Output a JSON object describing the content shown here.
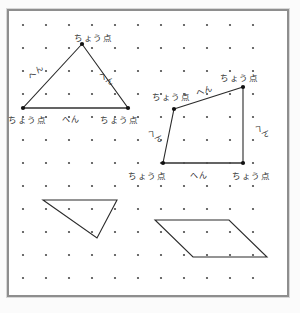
{
  "worksheet": {
    "title": "ちょう点とへん",
    "background_color": "#ffffff",
    "frame_color": "#8e8e8e",
    "line_color": "#2b2b2b",
    "label_color": "#2e2e2e"
  },
  "grid": {
    "columns": 11,
    "rows": 12,
    "spacing_px": 23,
    "origin_x": 23,
    "origin_y": 25,
    "dot_color": "#4a4a4a",
    "dot_radius": 1.1
  },
  "terms": {
    "vertex": "ちょう点",
    "edge": "へん"
  },
  "shapes": [
    {
      "id": "triangle-top-left",
      "type": "triangle",
      "labeled": true,
      "points": "82,44 23,108 128,108",
      "vertices": [
        {
          "x": 82,
          "y": 44
        },
        {
          "x": 23,
          "y": 108
        },
        {
          "x": 128,
          "y": 108
        }
      ],
      "base_emphasized": true
    },
    {
      "id": "quadrilateral-right",
      "type": "quadrilateral",
      "labeled": true,
      "points": "174,109 243,87 243,163 163,163",
      "vertices": [
        {
          "x": 174,
          "y": 109
        },
        {
          "x": 243,
          "y": 87
        },
        {
          "x": 243,
          "y": 163
        },
        {
          "x": 163,
          "y": 163
        }
      ],
      "base_emphasized": true
    },
    {
      "id": "triangle-bottom-left",
      "type": "triangle",
      "labeled": false,
      "points": "43,200 117,200 97,238",
      "vertices": [
        {
          "x": 43,
          "y": 200
        },
        {
          "x": 117,
          "y": 200
        },
        {
          "x": 97,
          "y": 238
        }
      ],
      "base_emphasized": false
    },
    {
      "id": "parallelogram-bottom-right",
      "type": "parallelogram",
      "labeled": false,
      "points": "155,220 229,220 267,257 193,257",
      "vertices": [
        {
          "x": 155,
          "y": 220
        },
        {
          "x": 229,
          "y": 220
        },
        {
          "x": 267,
          "y": 257
        },
        {
          "x": 193,
          "y": 257
        }
      ],
      "base_emphasized": false
    }
  ],
  "annotations": [
    {
      "id": "t1-vertex-top",
      "text": "ちょう点",
      "shape": "triangle-top-left",
      "kind": "vertex",
      "x": 74,
      "y": 34,
      "rotate": 0
    },
    {
      "id": "t1-edge-left",
      "text": "へん",
      "shape": "triangle-top-left",
      "kind": "edge",
      "x": 30,
      "y": 75,
      "rotate": -44
    },
    {
      "id": "t1-edge-right",
      "text": "へん",
      "shape": "triangle-top-left",
      "kind": "edge",
      "x": 99,
      "y": 70,
      "rotate": 36
    },
    {
      "id": "t1-vertex-bottom-left",
      "text": "ちょう点",
      "shape": "triangle-top-left",
      "kind": "vertex",
      "x": 8,
      "y": 116,
      "rotate": 0
    },
    {
      "id": "t1-edge-bottom",
      "text": "へん",
      "shape": "triangle-top-left",
      "kind": "edge",
      "x": 62,
      "y": 116,
      "rotate": 0
    },
    {
      "id": "t1-vertex-bottom-right",
      "text": "ちょう点",
      "shape": "triangle-top-left",
      "kind": "vertex",
      "x": 100,
      "y": 116,
      "rotate": 0
    },
    {
      "id": "q1-vertex-top-left",
      "text": "ちょう点",
      "shape": "quadrilateral-right",
      "kind": "vertex",
      "x": 152,
      "y": 93,
      "rotate": 0
    },
    {
      "id": "q1-edge-top",
      "text": "へん",
      "shape": "quadrilateral-right",
      "kind": "edge",
      "x": 196,
      "y": 90,
      "rotate": -17
    },
    {
      "id": "q1-vertex-top-right",
      "text": "ちょう点",
      "shape": "quadrilateral-right",
      "kind": "vertex",
      "x": 220,
      "y": 74,
      "rotate": 0
    },
    {
      "id": "q1-edge-left",
      "text": "へん",
      "shape": "quadrilateral-right",
      "kind": "edge",
      "x": 148,
      "y": 127,
      "rotate": 38
    },
    {
      "id": "q1-edge-right",
      "text": "へん",
      "shape": "quadrilateral-right",
      "kind": "edge",
      "x": 255,
      "y": 122,
      "rotate": 38
    },
    {
      "id": "q1-vertex-bottom-left",
      "text": "ちょう点",
      "shape": "quadrilateral-right",
      "kind": "vertex",
      "x": 128,
      "y": 172,
      "rotate": 0
    },
    {
      "id": "q1-edge-bottom",
      "text": "へん",
      "shape": "quadrilateral-right",
      "kind": "edge",
      "x": 190,
      "y": 172,
      "rotate": 0
    },
    {
      "id": "q1-vertex-bottom-right",
      "text": "ちょう点",
      "shape": "quadrilateral-right",
      "kind": "vertex",
      "x": 232,
      "y": 172,
      "rotate": 0
    }
  ]
}
